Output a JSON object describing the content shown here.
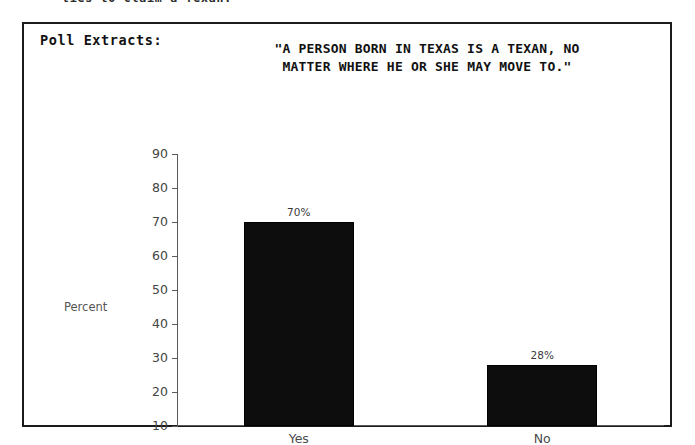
{
  "page": {
    "top_cutoff_text": "ties to claim a Texan."
  },
  "extract": {
    "section_label": "Poll Extracts:",
    "quote_line_1": "\"A PERSON BORN IN TEXAS IS A TEXAN, NO",
    "quote_line_2": "MATTER WHERE HE OR SHE MAY MOVE TO.\""
  },
  "chart_data": {
    "type": "bar",
    "title": "\"A PERSON BORN IN TEXAS IS A TEXAN, NO MATTER WHERE HE OR SHE MAY MOVE TO.\"",
    "categories": [
      "Yes",
      "No"
    ],
    "values": [
      70,
      28
    ],
    "data_labels": [
      "70%",
      "28%"
    ],
    "xlabel": "",
    "ylabel": "Percent",
    "ylim": [
      10,
      90
    ],
    "yticks": [
      90,
      80,
      70,
      60,
      50,
      40,
      30,
      20,
      10
    ],
    "ytick_labels": [
      "90",
      "80",
      "70",
      "60",
      "50",
      "40",
      "30",
      "20",
      "10"
    ],
    "grid": false,
    "legend": false,
    "bar_color": "#0d0d0d",
    "axis_color": "#5a5a5a"
  }
}
